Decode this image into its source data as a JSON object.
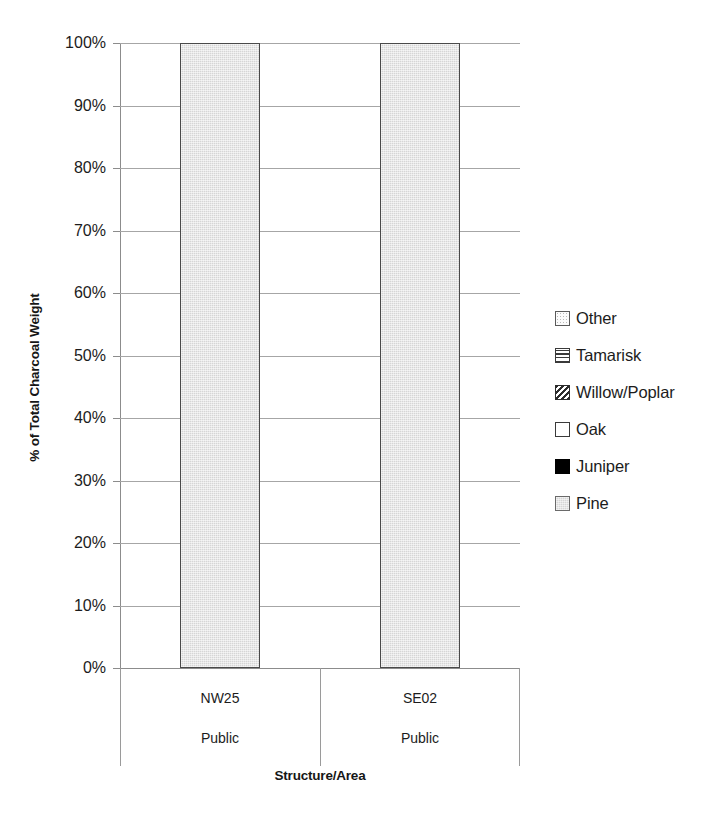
{
  "chart_data": {
    "type": "bar",
    "title": "",
    "xlabel": "Structure/Area",
    "ylabel": "% of Total Charcoal Weight",
    "ylim": [
      0,
      100
    ],
    "ytick_labels": [
      "0%",
      "10%",
      "20%",
      "30%",
      "40%",
      "50%",
      "60%",
      "70%",
      "80%",
      "90%",
      "100%"
    ],
    "ytick_values": [
      0,
      10,
      20,
      30,
      40,
      50,
      60,
      70,
      80,
      90,
      100
    ],
    "grid": true,
    "stacked": true,
    "legend_position": "right",
    "categories": [
      {
        "level1": "NW25",
        "level2": "Public"
      },
      {
        "level1": "SE02",
        "level2": "Public"
      }
    ],
    "series": [
      {
        "name": "Other",
        "pattern": "dotted",
        "values": [
          0,
          0
        ]
      },
      {
        "name": "Tamarisk",
        "pattern": "horizontal-lines",
        "values": [
          0,
          0
        ]
      },
      {
        "name": "Willow/Poplar",
        "pattern": "diagonal-hatch",
        "values": [
          0,
          0
        ]
      },
      {
        "name": "Oak",
        "pattern": "white",
        "values": [
          0,
          0
        ]
      },
      {
        "name": "Juniper",
        "pattern": "solid-black",
        "values": [
          0,
          0
        ]
      },
      {
        "name": "Pine",
        "pattern": "light-gray-fill",
        "values": [
          100,
          100
        ]
      }
    ]
  },
  "legend": {
    "items": [
      {
        "label": "Other",
        "swatch": "swatch-other"
      },
      {
        "label": "Tamarisk",
        "swatch": "swatch-tamarisk"
      },
      {
        "label": "Willow/Poplar",
        "swatch": "swatch-willow"
      },
      {
        "label": "Oak",
        "swatch": "swatch-oak"
      },
      {
        "label": "Juniper",
        "swatch": "swatch-juniper"
      },
      {
        "label": "Pine",
        "swatch": "swatch-pine"
      }
    ]
  },
  "colors": {
    "bar_fill": "#d6d6d6",
    "bar_border": "#4a4a4a",
    "gridline": "#a6a6a6",
    "axis_line": "#8c8c8c",
    "text": "#1c1c1c"
  }
}
